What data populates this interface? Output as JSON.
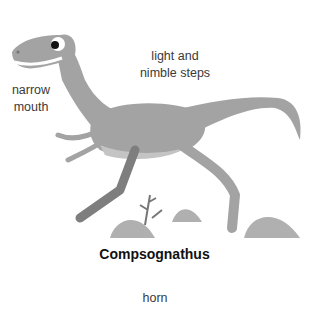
{
  "figure": {
    "title": "Compsognathus",
    "labels": {
      "mouth": [
        "narrow",
        "mouth"
      ],
      "steps": [
        "light and",
        "nimble steps"
      ],
      "bottom": "horn"
    },
    "colors": {
      "body": "#a3a3a3",
      "belly": "#c4c4c4",
      "legs_dark": "#7e7e7e",
      "rocks": "#b0b0b0",
      "text": "#3a3a3a"
    }
  }
}
